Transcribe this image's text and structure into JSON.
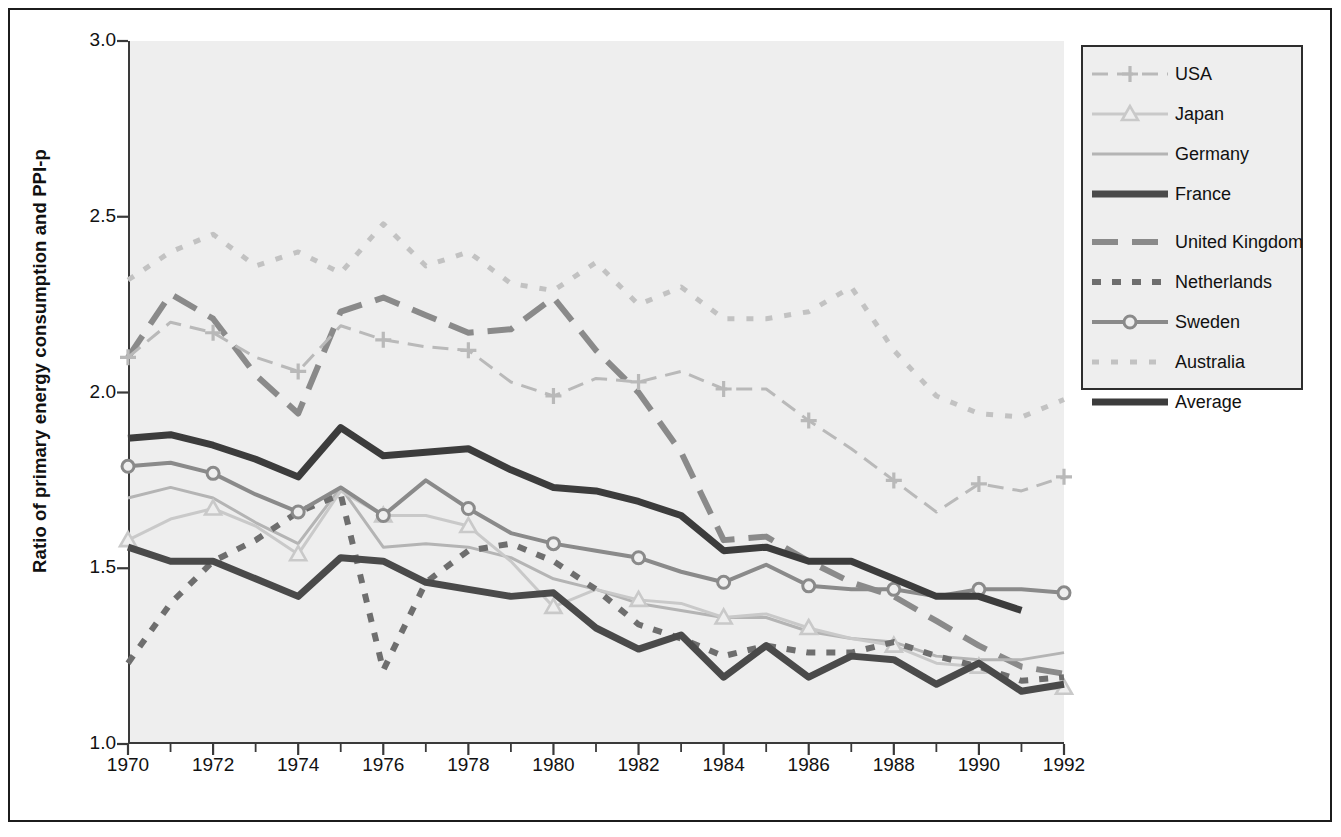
{
  "chart_data": {
    "type": "line",
    "title": "",
    "xlabel": "",
    "ylabel": "Ratio of primary energy consumption and PPI-p",
    "xlim": [
      1970,
      1992
    ],
    "ylim": [
      1.0,
      3.0
    ],
    "yticks": [
      "1.0",
      "1.5",
      "2.0",
      "2.5",
      "3.0"
    ],
    "ytick_values": [
      1.0,
      1.5,
      2.0,
      2.5,
      3.0
    ],
    "xticks": [
      "1970",
      "1972",
      "1974",
      "1976",
      "1978",
      "1980",
      "1982",
      "1984",
      "1986",
      "1988",
      "1990",
      "1992"
    ],
    "xtick_values": [
      1970,
      1972,
      1974,
      1976,
      1978,
      1980,
      1982,
      1984,
      1986,
      1988,
      1990,
      1992
    ],
    "minor_xticks": [
      1971,
      1973,
      1975,
      1977,
      1979,
      1981,
      1983,
      1985,
      1987,
      1989,
      1991
    ],
    "grid": false,
    "legend_position": "right-top",
    "x": [
      1970,
      1971,
      1972,
      1973,
      1974,
      1975,
      1976,
      1977,
      1978,
      1979,
      1980,
      1981,
      1982,
      1983,
      1984,
      1985,
      1986,
      1987,
      1988,
      1989,
      1990,
      1991,
      1992
    ],
    "series": [
      {
        "name": "USA",
        "color": "#b9b9b9",
        "style": "dash-plus",
        "marker": "plus",
        "width": 3,
        "values": [
          2.1,
          2.2,
          2.17,
          2.1,
          2.06,
          2.19,
          2.15,
          2.13,
          2.12,
          2.03,
          1.99,
          2.04,
          2.03,
          2.06,
          2.01,
          2.01,
          1.92,
          1.84,
          1.75,
          1.66,
          1.74,
          1.72,
          1.76
        ]
      },
      {
        "name": "Japan",
        "color": "#c9c9c9",
        "style": "solid-triangle",
        "marker": "triangle",
        "width": 3,
        "values": [
          1.58,
          1.64,
          1.67,
          1.62,
          1.54,
          1.72,
          1.65,
          1.65,
          1.62,
          1.52,
          1.39,
          1.44,
          1.41,
          1.4,
          1.36,
          1.37,
          1.33,
          1.3,
          1.28,
          1.23,
          1.22,
          1.15,
          1.16
        ]
      },
      {
        "name": "Germany",
        "color": "#b4b4b4",
        "style": "solid-thin",
        "marker": "none",
        "width": 3,
        "values": [
          1.7,
          1.73,
          1.7,
          1.63,
          1.57,
          1.73,
          1.56,
          1.57,
          1.56,
          1.53,
          1.47,
          1.44,
          1.4,
          1.38,
          1.36,
          1.36,
          1.32,
          1.3,
          1.29,
          1.25,
          1.24,
          1.24,
          1.26
        ]
      },
      {
        "name": "France",
        "color": "#4a4a4a",
        "style": "solid-thick",
        "marker": "none",
        "width": 7,
        "values": [
          1.56,
          1.52,
          1.52,
          1.47,
          1.42,
          1.53,
          1.52,
          1.46,
          1.44,
          1.42,
          1.43,
          1.33,
          1.27,
          1.31,
          1.19,
          1.28,
          1.19,
          1.25,
          1.24,
          1.17,
          1.23,
          1.15,
          1.17
        ]
      },
      {
        "name": "United Kingdom",
        "color": "#8a8a8a",
        "style": "long-dash",
        "marker": "none",
        "width": 6,
        "values": [
          2.1,
          2.28,
          2.21,
          2.05,
          1.94,
          2.23,
          2.27,
          2.22,
          2.17,
          2.18,
          2.27,
          2.12,
          2.0,
          1.83,
          1.58,
          1.59,
          1.52,
          1.46,
          1.42,
          1.35,
          1.28,
          1.22,
          1.2
        ]
      },
      {
        "name": "Netherlands",
        "color": "#6e6e6e",
        "style": "dotted-med",
        "marker": "none",
        "width": 6,
        "values": [
          1.23,
          1.4,
          1.52,
          1.58,
          1.66,
          1.71,
          1.21,
          1.46,
          1.55,
          1.57,
          1.52,
          1.44,
          1.34,
          1.3,
          1.25,
          1.28,
          1.26,
          1.26,
          1.29,
          1.25,
          1.22,
          1.18,
          1.19
        ]
      },
      {
        "name": "Sweden",
        "color": "#8a8a8a",
        "style": "solid-circle",
        "marker": "circle",
        "width": 4,
        "values": [
          1.79,
          1.8,
          1.77,
          1.71,
          1.66,
          1.73,
          1.65,
          1.75,
          1.67,
          1.6,
          1.57,
          1.55,
          1.53,
          1.49,
          1.46,
          1.51,
          1.45,
          1.44,
          1.44,
          1.42,
          1.44,
          1.44,
          1.43
        ]
      },
      {
        "name": "Australia",
        "color": "#c2c2c2",
        "style": "dotted-fine",
        "marker": "none",
        "width": 5,
        "values": [
          2.32,
          2.4,
          2.45,
          2.36,
          2.4,
          2.34,
          2.48,
          2.36,
          2.4,
          2.31,
          2.29,
          2.37,
          2.25,
          2.3,
          2.21,
          2.21,
          2.23,
          2.3,
          2.12,
          1.99,
          1.94,
          1.93,
          1.98
        ]
      },
      {
        "name": "Average",
        "color": "#3c3c3c",
        "style": "solid-thick",
        "marker": "none",
        "width": 7,
        "values": [
          1.87,
          1.88,
          1.85,
          1.81,
          1.76,
          1.9,
          1.82,
          1.83,
          1.84,
          1.78,
          1.73,
          1.72,
          1.69,
          1.65,
          1.55,
          1.56,
          1.52,
          1.52,
          1.47,
          1.42,
          1.42,
          1.38,
          null
        ]
      }
    ]
  },
  "axis": {
    "ylabel": "Ratio of primary energy consumption and PPI-p",
    "yticks": [
      "3.0",
      "2.5",
      "2.0",
      "1.5",
      "1.0"
    ],
    "xticks": [
      "1970",
      "1972",
      "1974",
      "1976",
      "1978",
      "1980",
      "1982",
      "1984",
      "1986",
      "1988",
      "1990",
      "1992"
    ]
  },
  "legend": {
    "items": [
      {
        "label": "USA"
      },
      {
        "label": "Japan"
      },
      {
        "label": "Germany"
      },
      {
        "label": "France"
      },
      {
        "label": "United Kingdom"
      },
      {
        "label": "Netherlands"
      },
      {
        "label": "Sweden"
      },
      {
        "label": "Australia"
      },
      {
        "label": "Average"
      }
    ]
  }
}
